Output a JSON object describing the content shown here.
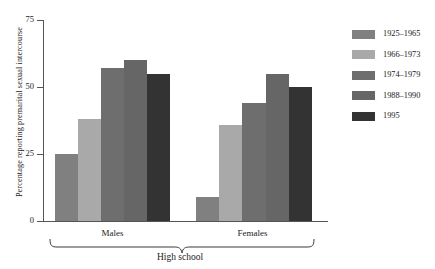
{
  "chart_data": {
    "type": "bar",
    "title": "",
    "subtitle": "",
    "xlabel": "High school",
    "ylabel": "Percentage reporting premarital sexual intercourse",
    "categories": [
      "Males",
      "Females"
    ],
    "ylim": [
      0,
      75
    ],
    "yticks": [
      "0",
      "25",
      "50",
      "75"
    ],
    "ytick_values": [
      0,
      25,
      50,
      75
    ],
    "grid": false,
    "legend_position": "right",
    "series": [
      {
        "name": "1925–1965",
        "color": "#808080",
        "values": [
          25,
          9
        ]
      },
      {
        "name": "1966–1973",
        "color": "#a9a9a9",
        "values": [
          38,
          36
        ]
      },
      {
        "name": "1974–1979",
        "color": "#6e6e6e",
        "values": [
          57,
          44
        ]
      },
      {
        "name": "1988–1990",
        "color": "#666666",
        "values": [
          60,
          55
        ]
      },
      {
        "name": "1995",
        "color": "#333333",
        "values": [
          55,
          50
        ]
      }
    ],
    "annotations": [
      "High school"
    ]
  },
  "axis": {
    "ytitle": "Percentage reporting premarital sexual intercourse",
    "tick_75": "75",
    "tick_50": "50",
    "tick_25": "25",
    "tick_0": "0"
  },
  "groups": {
    "males": "Males",
    "females": "Females",
    "bracket": "High school"
  },
  "legend": {
    "items": [
      {
        "label": "1925–1965"
      },
      {
        "label": "1966–1973"
      },
      {
        "label": "1974–1979"
      },
      {
        "label": "1988–1990"
      },
      {
        "label": "1995"
      }
    ]
  }
}
